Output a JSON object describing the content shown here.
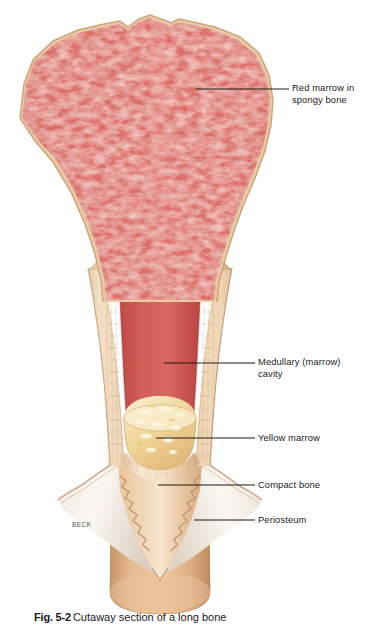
{
  "figure": {
    "artist_signature": "BECK",
    "caption_number": "Fig. 5-2",
    "caption_text": "Cutaway section of a long bone"
  },
  "labels": [
    {
      "id": "red-marrow",
      "text": "Red marrow in\nspongy bone",
      "leader": {
        "x1": 196,
        "y1": 89,
        "x2": 289,
        "y2": 89
      }
    },
    {
      "id": "medullary",
      "text": "Medullary (marrow)\ncavity",
      "leader": {
        "x1": 164,
        "y1": 363,
        "x2": 255,
        "y2": 363
      }
    },
    {
      "id": "yellow",
      "text": "Yellow marrow",
      "leader": {
        "x1": 156,
        "y1": 438,
        "x2": 255,
        "y2": 438
      }
    },
    {
      "id": "compact",
      "text": "Compact bone",
      "leader": {
        "x1": 158,
        "y1": 485,
        "x2": 255,
        "y2": 485
      }
    },
    {
      "id": "periosteum",
      "text": "Periosteum",
      "leader": {
        "x1": 194,
        "y1": 520,
        "x2": 255,
        "y2": 520
      }
    }
  ],
  "anatomy": {
    "regions": [
      {
        "name": "epiphysis",
        "description": "Flared bone head filled with red marrow in spongy bone"
      },
      {
        "name": "metaphysis",
        "description": "Concave flaring taper between head and shaft"
      },
      {
        "name": "diaphysis",
        "description": "Narrow shaft walled by compact bone"
      },
      {
        "name": "medullary-cavity",
        "description": "Central marrow cavity within the shaft"
      },
      {
        "name": "yellow-marrow",
        "description": "Fatty yellow marrow mass in lower cavity"
      },
      {
        "name": "periosteum",
        "description": "White fibrous membrane peeled back from shaft"
      },
      {
        "name": "compact-bone",
        "description": "Dense tan cortical bone of the lower shaft"
      }
    ]
  },
  "colors": {
    "spongy_red": "#d9635e",
    "spongy_red_light": "#e8938c",
    "spongy_red_dark": "#bc4a48",
    "cortical_cream": "#f2dcc0",
    "cortical_cream_hi": "#faeedd",
    "cortical_edge": "#c79a74",
    "compact_tan": "#e0b188",
    "compact_tan_dark": "#c08f64",
    "yellow_marrow": "#efce8e",
    "yellow_marrow_hi": "#f8ecc6",
    "periosteum_white": "#f6f2ed",
    "periosteum_shade": "#ded3c8",
    "leader_line": "#1b1b1b",
    "label_text": "#1b1b1b",
    "background": "#ffffff"
  }
}
